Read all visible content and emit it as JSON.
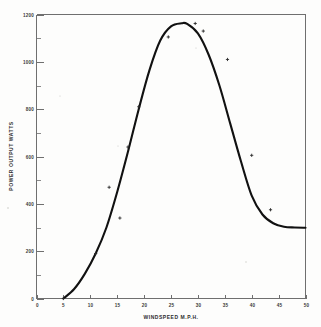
{
  "chart_data": {
    "type": "line",
    "title": "",
    "xlabel": "WINDSPEED M.P.H.",
    "ylabel": "POWER OUTPUT  WATTS",
    "xlim": [
      0,
      50
    ],
    "ylim": [
      0,
      1200
    ],
    "grid": false,
    "legend": "none",
    "x_ticks": [
      0,
      5,
      10,
      15,
      20,
      25,
      30,
      35,
      40,
      45,
      50
    ],
    "x_tick_labels": [
      "0",
      "5",
      "10",
      "15",
      "20",
      "25",
      "30",
      "35",
      "40",
      "45",
      "50"
    ],
    "y_ticks": [
      0,
      200,
      400,
      600,
      800,
      1000,
      1200
    ],
    "y_tick_labels": [
      "0",
      "200",
      "400",
      "600",
      "800",
      "1000",
      "1200"
    ],
    "y_minor_ticks": [
      100,
      300,
      500,
      700,
      900,
      1100
    ],
    "series": [
      {
        "name": "power curve",
        "x": [
          5,
          7,
          9,
          11,
          13,
          15,
          17,
          19,
          21,
          23,
          25,
          27,
          28,
          30,
          32,
          34,
          36,
          38,
          40,
          42,
          44,
          46,
          48,
          50
        ],
        "values": [
          0,
          40,
          105,
          190,
          300,
          450,
          620,
          800,
          965,
          1090,
          1150,
          1163,
          1160,
          1120,
          1030,
          900,
          740,
          580,
          435,
          355,
          318,
          303,
          300,
          299
        ]
      }
    ],
    "data_points": {
      "x": [
        5,
        11,
        13.5,
        15.5,
        17,
        19,
        24.5,
        29.5,
        31,
        35.5,
        40,
        43.5
      ],
      "y": [
        0,
        190,
        470,
        340,
        640,
        810,
        1105,
        1162,
        1130,
        1010,
        605,
        375
      ]
    },
    "annotations": []
  },
  "axis": {
    "x_title": "WINDSPEED M.P.H.",
    "y_title": "POWER OUTPUT  WATTS"
  }
}
